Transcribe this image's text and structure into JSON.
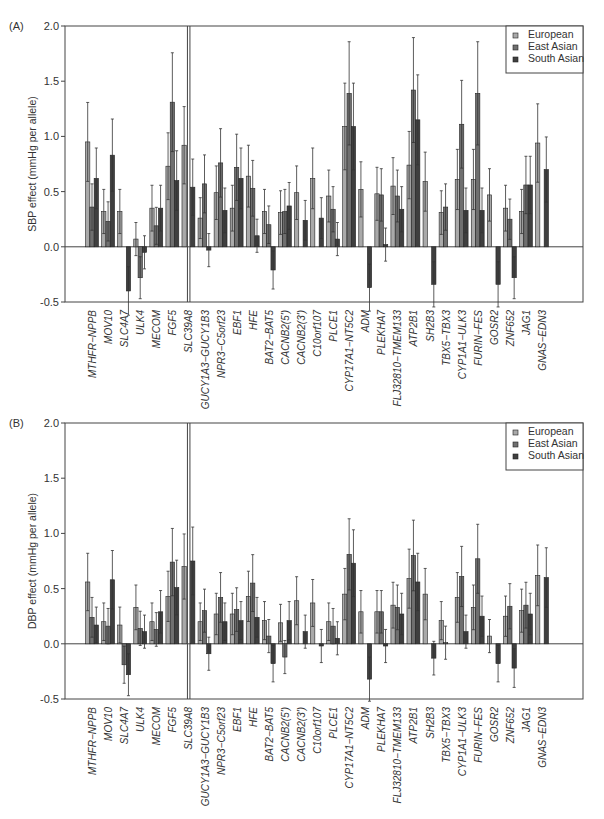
{
  "legend": [
    {
      "name": "European",
      "color": "#a9a9a9"
    },
    {
      "name": "East Asian",
      "color": "#6f6f6f"
    },
    {
      "name": "South Asian",
      "color": "#3f3f3f"
    }
  ],
  "chart_data": [
    {
      "type": "bar",
      "panel_label": "(A)",
      "title": "",
      "xlabel": "",
      "ylabel": "SBP effect (mmHg per allele)",
      "ylim": [
        -0.5,
        2.0
      ],
      "yticks": [
        "-0.5",
        "0.0",
        "0.5",
        "1.0",
        "1.5",
        "2.0"
      ],
      "grid": false,
      "legend_position": "top-right",
      "categories": [
        "MTHFR-NPPB",
        "MOV10",
        "SLC4A7",
        "ULK4",
        "MECOM",
        "FGF5",
        "SLC39A8",
        "GUCY1A3-GUCY1B3",
        "NPR3-C5orf23",
        "EBF1",
        "HFE",
        "BAT2-BAT5",
        "CACNB2(5')",
        "CACNB2(3')",
        "C10orf107",
        "PLCE1",
        "CYP17A1-NT5C2",
        "ADM",
        "PLEKHA7",
        "FLJ32810-TMEM133",
        "ATP2B1",
        "SH2B3",
        "TBX5-TBX3",
        "CYP1A1-ULK3",
        "FURIN-FES",
        "GOSR2",
        "ZNF652",
        "JAG1",
        "GNAS-EDN3"
      ],
      "series": [
        {
          "name": "European",
          "values": [
            0.95,
            0.32,
            0.32,
            0.07,
            0.35,
            0.73,
            0.92,
            0.26,
            0.49,
            0.35,
            0.64,
            0.32,
            0.31,
            0.49,
            0.62,
            0.46,
            1.09,
            0.52,
            0.48,
            0.55,
            0.74,
            0.59,
            0.31,
            0.61,
            0.61,
            0.47,
            0.35,
            0.32,
            0.94
          ]
        },
        {
          "name": "East Asian",
          "values": [
            0.36,
            0.23,
            null,
            -0.28,
            0.19,
            1.31,
            3.5,
            0.57,
            0.76,
            0.72,
            0.53,
            0.2,
            0.32,
            null,
            null,
            0.34,
            1.39,
            null,
            0.47,
            0.46,
            1.42,
            null,
            0.36,
            1.11,
            1.39,
            null,
            0.25,
            0.56,
            null
          ]
        },
        {
          "name": "South Asian",
          "values": [
            0.62,
            0.83,
            -0.4,
            -0.05,
            0.35,
            0.6,
            0.54,
            -0.03,
            0.33,
            0.62,
            0.1,
            -0.21,
            0.37,
            0.24,
            0.26,
            0.07,
            1.09,
            -0.37,
            0.02,
            0.34,
            1.15,
            -0.34,
            null,
            0.33,
            0.33,
            -0.34,
            -0.28,
            0.56,
            0.7
          ]
        }
      ],
      "annotations": [
        "P=0.0046",
        "P=0.0014",
        "P=0.004"
      ]
    },
    {
      "type": "bar",
      "panel_label": "(B)",
      "title": "",
      "xlabel": "",
      "ylabel": "DBP effect (mmHg per allele)",
      "ylim": [
        -0.5,
        2.0
      ],
      "yticks": [
        "-0.5",
        "0.0",
        "0.5",
        "1.0",
        "1.5",
        "2.0"
      ],
      "grid": false,
      "legend_position": "top-right",
      "categories": [
        "MTHFR-NPPB",
        "MOV10",
        "SLC4A7",
        "ULK4",
        "MECOM",
        "FGF5",
        "SLC39A8",
        "GUCY1A3-GUCY1B3",
        "NPR3-C5orf23",
        "EBF1",
        "HFE",
        "BAT2-BAT5",
        "CACNB2(5')",
        "CACNB2(3')",
        "C10orf107",
        "PLCE1",
        "CYP17A1-NT5C2",
        "ADM",
        "PLEKHA7",
        "FLJ32810-TMEM133",
        "ATP2B1",
        "SH2B3",
        "TBX5-TBX3",
        "CYP1A1-ULK3",
        "FURIN-FES",
        "GOSR2",
        "ZNF652",
        "JAG1",
        "GNAS-EDN3"
      ],
      "series": [
        {
          "name": "European",
          "values": [
            0.56,
            0.2,
            0.17,
            0.33,
            0.2,
            0.43,
            0.7,
            0.2,
            0.27,
            0.27,
            0.43,
            0.21,
            0.19,
            0.39,
            0.37,
            0.2,
            0.45,
            0.29,
            0.29,
            0.35,
            0.59,
            0.45,
            0.21,
            0.42,
            0.33,
            0.07,
            0.25,
            0.3,
            0.62
          ]
        },
        {
          "name": "East Asian",
          "values": [
            0.24,
            0.16,
            -0.19,
            0.14,
            0.13,
            0.74,
            3.5,
            0.3,
            0.42,
            0.31,
            0.55,
            0.07,
            -0.12,
            null,
            null,
            0.16,
            0.81,
            null,
            0.29,
            0.33,
            0.8,
            null,
            0.01,
            0.61,
            0.77,
            null,
            0.34,
            0.35,
            null
          ]
        },
        {
          "name": "South Asian",
          "values": [
            0.17,
            0.58,
            -0.28,
            0.11,
            0.29,
            0.51,
            0.75,
            -0.09,
            0.2,
            0.21,
            0.24,
            -0.18,
            0.21,
            0.11,
            -0.02,
            0.05,
            0.73,
            -0.32,
            -0.02,
            0.27,
            0.56,
            -0.13,
            null,
            0.11,
            0.25,
            -0.18,
            -0.22,
            0.27,
            0.6
          ]
        }
      ],
      "annotations": [
        "P=0.0007",
        "P=0.004",
        "P=0.0019"
      ]
    }
  ]
}
